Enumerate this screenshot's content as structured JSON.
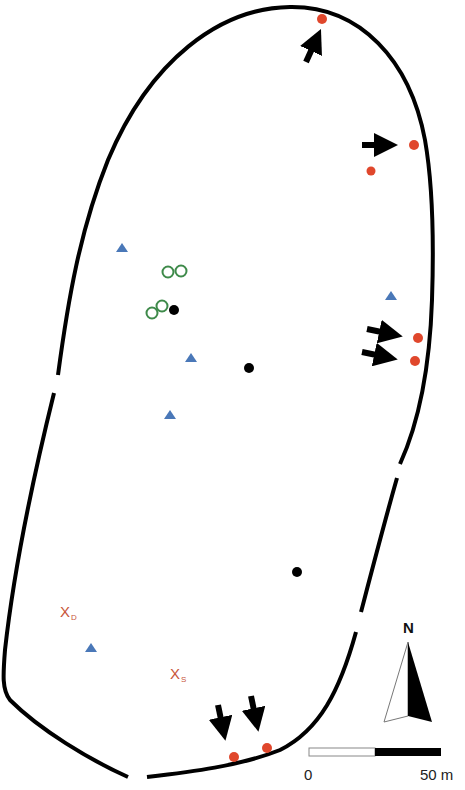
{
  "map": {
    "colors": {
      "outline": "#000000",
      "red_dot": "#e0472c",
      "blue_triangle": "#4a78b8",
      "green_circle": "#3e8a4a",
      "black_dot": "#000000",
      "x_label": "#c8553a"
    },
    "labels": {
      "x_d_main": "X",
      "x_d_sub": "D",
      "x_s_main": "X",
      "x_s_sub": "S"
    },
    "north_arrow": {
      "label": "N"
    },
    "scale_bar": {
      "start_label": "0",
      "end_label": "50 m"
    },
    "markers": {
      "red_dots": [
        {
          "x": 322,
          "y": 19
        },
        {
          "x": 413,
          "y": 145
        },
        {
          "x": 371,
          "y": 171
        },
        {
          "x": 418,
          "y": 338
        },
        {
          "x": 415,
          "y": 361
        },
        {
          "x": 234,
          "y": 757
        },
        {
          "x": 267,
          "y": 748
        }
      ],
      "blue_triangles": [
        {
          "x": 122,
          "y": 248
        },
        {
          "x": 391,
          "y": 296
        },
        {
          "x": 191,
          "y": 358
        },
        {
          "x": 169,
          "y": 415
        },
        {
          "x": 91,
          "y": 648
        }
      ],
      "green_circles": [
        {
          "x": 168,
          "y": 272
        },
        {
          "x": 181,
          "y": 271
        },
        {
          "x": 162,
          "y": 306
        },
        {
          "x": 152,
          "y": 313
        }
      ],
      "black_dots": [
        {
          "x": 174,
          "y": 310
        },
        {
          "x": 249,
          "y": 368
        },
        {
          "x": 297,
          "y": 572
        }
      ],
      "arrows": [
        {
          "x1": 306,
          "y1": 62,
          "x2": 320,
          "y2": 32
        },
        {
          "x1": 362,
          "y1": 145,
          "x2": 398,
          "y2": 145
        },
        {
          "x1": 367,
          "y1": 330,
          "x2": 403,
          "y2": 337
        },
        {
          "x1": 362,
          "y1": 352,
          "x2": 398,
          "y2": 359
        },
        {
          "x1": 221,
          "y1": 705,
          "x2": 227,
          "y2": 741
        },
        {
          "x1": 254,
          "y1": 696,
          "x2": 260,
          "y2": 732
        }
      ]
    }
  }
}
